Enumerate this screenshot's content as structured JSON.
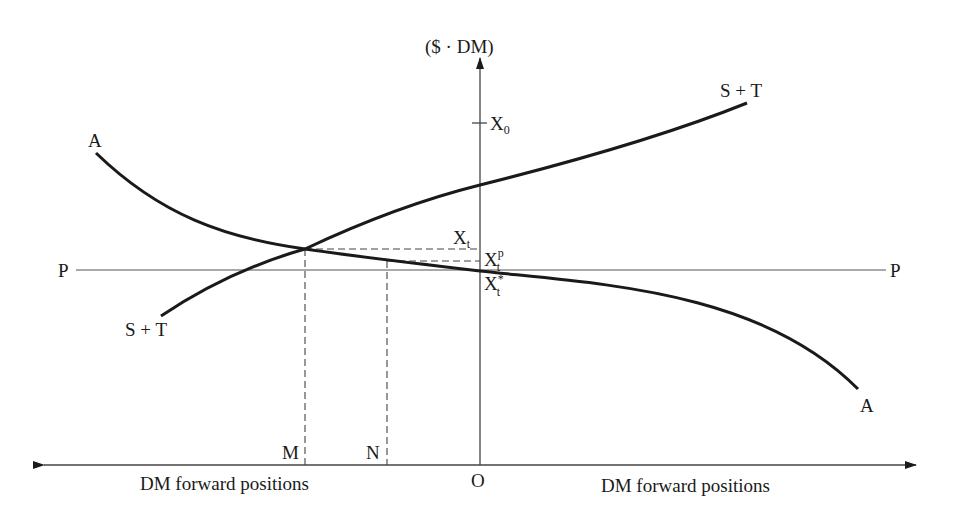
{
  "diagram": {
    "y_axis_label": "($ · DM)",
    "origin_label": "O",
    "x_axis_left_label": "DM forward positions",
    "x_axis_right_label": "DM forward positions",
    "curve_A": {
      "label_start": "A",
      "label_end": "A"
    },
    "curve_ST": {
      "label_start": "S + T",
      "label_end": "S + T"
    },
    "line_P": {
      "label_left": "P",
      "label_right": "P"
    },
    "points": {
      "M": "M",
      "N": "N"
    },
    "y_levels": {
      "X0": {
        "main": "X",
        "sub": "0"
      },
      "Xt": {
        "main": "X",
        "sub": "t"
      },
      "Xtp": {
        "main": "X",
        "sub": "t",
        "sup": "p"
      },
      "Xtstar": {
        "main": "X",
        "sub": "t",
        "sup": "*"
      }
    },
    "colors": {
      "background": "#ffffff",
      "ink": "#1a1a1a",
      "thin_line": "#444444"
    }
  }
}
